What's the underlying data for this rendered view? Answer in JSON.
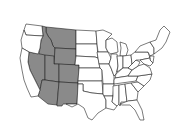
{
  "map": {
    "title": "United States (lower 48)",
    "highlight_color": "#8a8a8a",
    "base_color": "#ffffff",
    "outline_color": "#222222",
    "highlighted_states": [
      "Montana",
      "Idaho",
      "Wyoming",
      "Nevada",
      "Utah",
      "Colorado",
      "Arizona",
      "New Mexico"
    ],
    "region": "Mountain West"
  }
}
